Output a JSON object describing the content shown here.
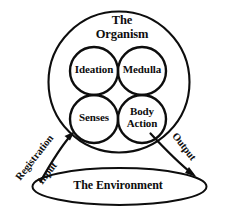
{
  "diagram": {
    "title_lines": [
      "The",
      "Organism"
    ],
    "outer_shape_name": "The Organism",
    "environment_label": "The Environment",
    "nodes": [
      {
        "id": "ideation",
        "label": "Ideation"
      },
      {
        "id": "medulla",
        "label": "Medulla"
      },
      {
        "id": "senses",
        "label": "Senses"
      },
      {
        "id": "body-action",
        "label_line_1": "Body",
        "label_line_2": "Action"
      }
    ],
    "flows": [
      {
        "id": "input",
        "labels": [
          "Registration",
          "Input"
        ],
        "from": "The Environment",
        "to": "Senses"
      },
      {
        "id": "output",
        "labels": [
          "Output"
        ],
        "from": "Body Action",
        "to": "The Environment"
      }
    ],
    "labels": {
      "registration": "Registration",
      "input": "Input",
      "output": "Output"
    },
    "colors": {
      "stroke": "#0d0d0d",
      "background": "#ffffff",
      "text": "#0d0d0d"
    }
  }
}
